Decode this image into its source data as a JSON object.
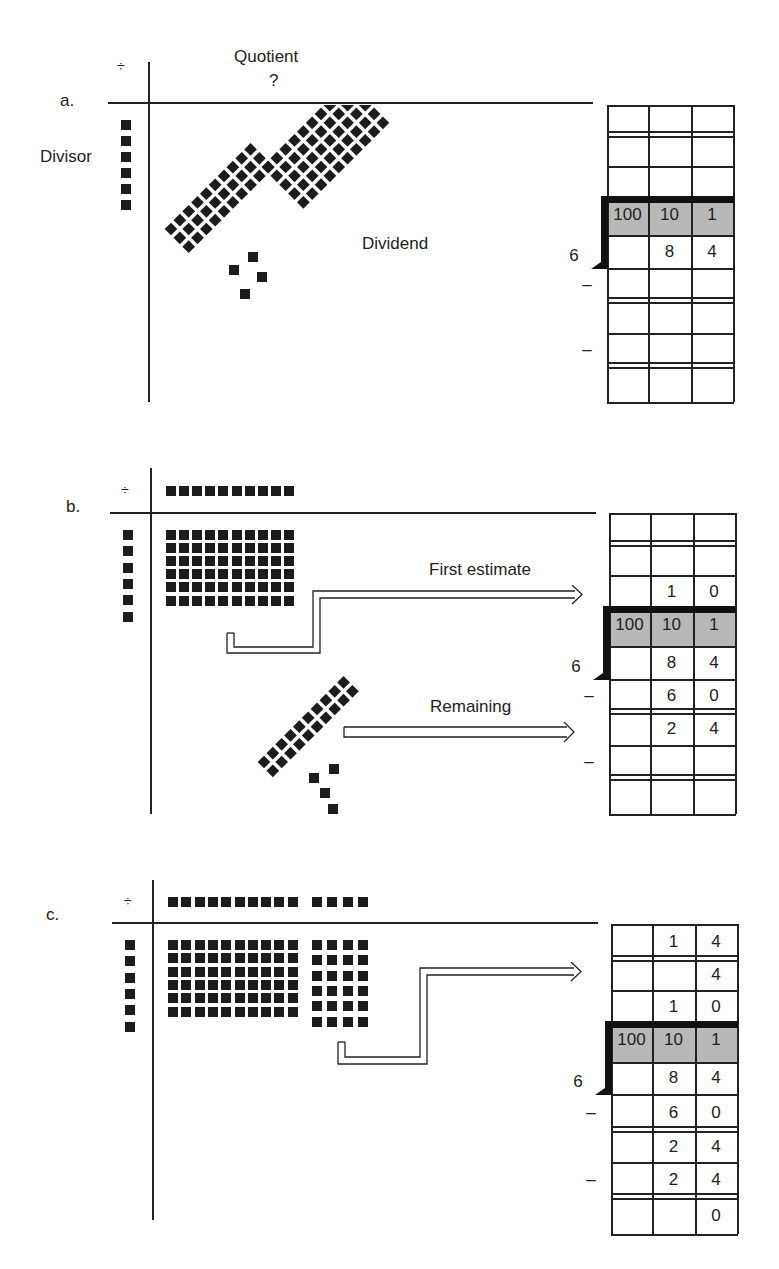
{
  "panels": [
    {
      "id": "a",
      "label": "a.",
      "divide_sign": "÷",
      "quotient_label": "Quotient",
      "quotient_value": "?",
      "divisor_label": "Divisor",
      "dividend_label": "Dividend",
      "divisor": "6",
      "place_headers": [
        "100",
        "10",
        "1"
      ],
      "grid_rows": [
        [
          "",
          "",
          ""
        ],
        [
          "",
          "",
          ""
        ],
        [
          "",
          "",
          ""
        ],
        [
          "",
          "8",
          "4"
        ],
        [
          "",
          "",
          ""
        ],
        [
          "",
          "",
          ""
        ],
        [
          "",
          "",
          ""
        ],
        [
          "",
          "",
          ""
        ]
      ],
      "minus_signs": [
        "–",
        "–"
      ]
    },
    {
      "id": "b",
      "label": "b.",
      "divide_sign": "÷",
      "first_estimate_label": "First estimate",
      "remaining_label": "Remaining",
      "divisor": "6",
      "place_headers": [
        "100",
        "10",
        "1"
      ],
      "grid_rows": [
        [
          "",
          "",
          ""
        ],
        [
          "",
          "",
          ""
        ],
        [
          "",
          "1",
          "0"
        ],
        [
          "",
          "8",
          "4"
        ],
        [
          "",
          "6",
          "0"
        ],
        [
          "",
          "2",
          "4"
        ],
        [
          "",
          "",
          ""
        ],
        [
          "",
          "",
          ""
        ]
      ],
      "minus_signs": [
        "–",
        "–"
      ]
    },
    {
      "id": "c",
      "label": "c.",
      "divide_sign": "÷",
      "divisor": "6",
      "place_headers": [
        "100",
        "10",
        "1"
      ],
      "grid_rows": [
        [
          "",
          "1",
          "4"
        ],
        [
          "",
          "",
          "4"
        ],
        [
          "",
          "1",
          "0"
        ],
        [
          "",
          "8",
          "4"
        ],
        [
          "",
          "6",
          "0"
        ],
        [
          "",
          "2",
          "4"
        ],
        [
          "",
          "2",
          "4"
        ],
        [
          "",
          "",
          "0"
        ]
      ],
      "minus_signs": [
        "–",
        "–"
      ]
    }
  ]
}
